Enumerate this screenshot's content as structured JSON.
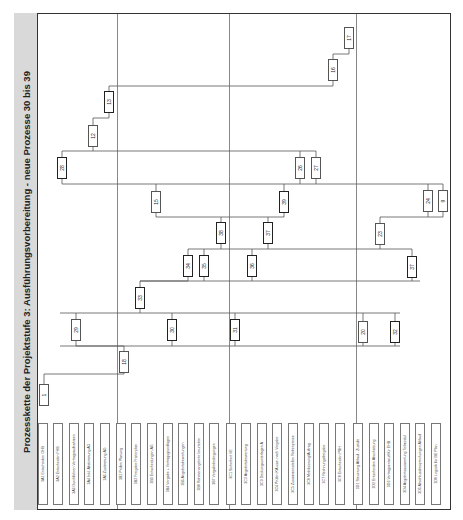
{
  "title": "Prozesskette der Projektstufe 3: Ausführungsvorbereitung - neue Prozesse 30 bis 39",
  "groups": [
    {
      "id": "3A",
      "separator_x": 117
    },
    {
      "id": "3B",
      "separator_x": 229
    },
    {
      "id": "3C",
      "separator_x": 356
    },
    {
      "id": "3D"
    }
  ],
  "row_labels": [
    {
      "code": "3A1",
      "label": "3A1 Entscheiden OHB",
      "x": 43
    },
    {
      "code": "3A2",
      "label": "3A2 Entscheiden FHB",
      "x": 58
    },
    {
      "code": "3A3",
      "label": "3A3 Durchführen Vertragsaufnahmen",
      "x": 74
    },
    {
      "code": "3A4",
      "label": "3A4 Inkl. Abstimmung AG",
      "x": 89
    },
    {
      "code": "3A5",
      "label": "3A5 Zustimmung AG",
      "x": 105
    },
    {
      "code": "3B1",
      "label": "3B1 Prüfen Planung",
      "x": 121
    },
    {
      "code": "3B2",
      "label": "3B2 Freigabe Fristenplan",
      "x": 136
    },
    {
      "code": "3B3",
      "label": "3B3 Entscheidungen AG",
      "x": 152
    },
    {
      "code": "3B4",
      "label": "3B4 Vergabe + Vertragsgrundlagen",
      "x": 168
    },
    {
      "code": "3B5",
      "label": "3B5 Angebotsbewertungen",
      "x": 183
    },
    {
      "code": "3B6",
      "label": "3B6 Rahmenangebote beurteilen",
      "x": 199
    },
    {
      "code": "3B7",
      "label": "3B7 Vergabebedingungen",
      "x": 214
    },
    {
      "code": "3C1",
      "label": "3C1 Sicherheit VE",
      "x": 231
    },
    {
      "code": "3C2",
      "label": "3C2 Angebotsbewertung",
      "x": 246
    },
    {
      "code": "3C3",
      "label": "3C3 Deckungsunterlagen A",
      "x": 262
    },
    {
      "code": "3C4",
      "label": "3C4 Prüfen KA usw. nach Vergabe",
      "x": 277
    },
    {
      "code": "3C5",
      "label": "3C5 Zusammenstellen Nebenpreise",
      "x": 293
    },
    {
      "code": "3C6",
      "label": "3C6 Mobilisierung/Auftrag",
      "x": 309
    },
    {
      "code": "3C7",
      "label": "3C7 Rechnungsfreigabe",
      "x": 324
    },
    {
      "code": "3C8",
      "label": "3C8 Entscheiden PBH",
      "x": 340
    },
    {
      "code": "3D1",
      "label": "3D1 Steuerung Ablauf - Zustufe",
      "x": 358
    },
    {
      "code": "3D2",
      "label": "3D2 Entscheiden Abschätzung",
      "x": 374
    },
    {
      "code": "3D3",
      "label": "3D3 Vertragsentwurf für EHB",
      "x": 389
    },
    {
      "code": "3D4",
      "label": "3D4 Angebotsauswertung Teilmodul",
      "x": 405
    },
    {
      "code": "3D5",
      "label": "3D5 Abschlussbesprechungen Ablauf",
      "x": 420
    },
    {
      "code": "3D6",
      "label": "3D6 Logistik für BE Plan",
      "x": 436
    }
  ],
  "nodes": [
    {
      "id": "1",
      "x": 44,
      "y": 395,
      "bold": false
    },
    {
      "id": "18",
      "x": 124,
      "y": 362,
      "bold": false
    },
    {
      "id": "29",
      "x": 76,
      "y": 330,
      "bold": false
    },
    {
      "id": "30",
      "x": 172,
      "y": 330,
      "bold": true
    },
    {
      "id": "31",
      "x": 235,
      "y": 330,
      "bold": true
    },
    {
      "id": "20",
      "x": 363,
      "y": 332,
      "bold": false
    },
    {
      "id": "32",
      "x": 395,
      "y": 332,
      "bold": true
    },
    {
      "id": "33",
      "x": 140,
      "y": 298,
      "bold": true
    },
    {
      "id": "34",
      "x": 188,
      "y": 266,
      "bold": true
    },
    {
      "id": "35",
      "x": 204,
      "y": 266,
      "bold": true
    },
    {
      "id": "36",
      "x": 252,
      "y": 266,
      "bold": true
    },
    {
      "id": "37",
      "x": 412,
      "y": 267,
      "bold": true
    },
    {
      "id": "38",
      "x": 221,
      "y": 233,
      "bold": true
    },
    {
      "id": "37b",
      "label": "37",
      "x": 268,
      "y": 233,
      "bold": true
    },
    {
      "id": "23",
      "x": 380,
      "y": 234,
      "bold": false
    },
    {
      "id": "15",
      "x": 156,
      "y": 202,
      "bold": false
    },
    {
      "id": "39",
      "x": 284,
      "y": 202,
      "bold": true
    },
    {
      "id": "24",
      "x": 428,
      "y": 201,
      "bold": false
    },
    {
      "id": "9",
      "x": 443,
      "y": 201,
      "bold": false
    },
    {
      "id": "28",
      "x": 62,
      "y": 168,
      "bold": true
    },
    {
      "id": "26",
      "x": 300,
      "y": 168,
      "bold": false
    },
    {
      "id": "27",
      "x": 316,
      "y": 168,
      "bold": false
    },
    {
      "id": "12",
      "x": 93,
      "y": 136,
      "bold": false
    },
    {
      "id": "13",
      "x": 109,
      "y": 102,
      "bold": true
    },
    {
      "id": "16",
      "x": 333,
      "y": 70,
      "bold": false
    },
    {
      "id": "17",
      "x": 349,
      "y": 38,
      "bold": false
    }
  ],
  "colors": {
    "title_band": "#d9d9d9",
    "frame": "#333333",
    "separator": "#888888",
    "link": "#555555"
  }
}
